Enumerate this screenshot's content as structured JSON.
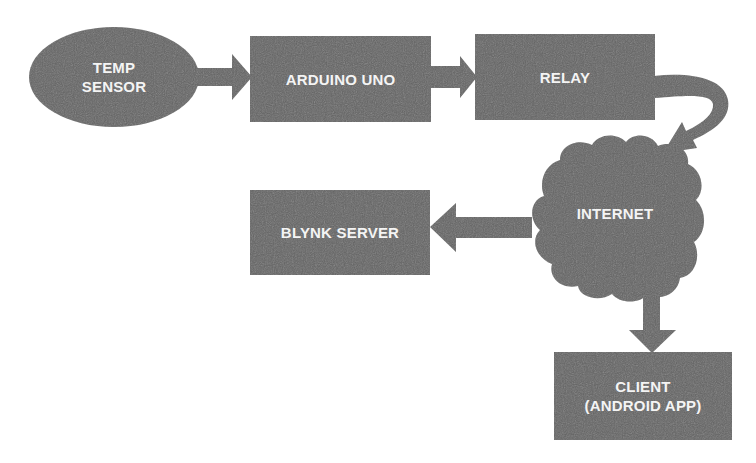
{
  "diagram": {
    "type": "flowchart",
    "colors": {
      "background": "#ffffff",
      "node_fill": "#646464",
      "arrow_fill": "#646464",
      "text": "#f4f4f4"
    },
    "nodes": {
      "temp_sensor": {
        "line1": "TEMP",
        "line2": "SENSOR",
        "shape": "ellipse"
      },
      "arduino": {
        "label": "ARDUINO UNO",
        "shape": "rectangle"
      },
      "relay": {
        "label": "RELAY",
        "shape": "rectangle"
      },
      "internet": {
        "label": "INTERNET",
        "shape": "cloud"
      },
      "blynk": {
        "label": "BLYNK SERVER",
        "shape": "rectangle"
      },
      "client": {
        "line1": "CLIENT",
        "line2": "(ANDROID APP)",
        "shape": "rectangle"
      }
    },
    "edges": [
      {
        "from": "TEMP SENSOR",
        "to": "ARDUINO UNO"
      },
      {
        "from": "ARDUINO UNO",
        "to": "RELAY"
      },
      {
        "from": "RELAY",
        "to": "INTERNET"
      },
      {
        "from": "INTERNET",
        "to": "BLYNK SERVER"
      },
      {
        "from": "INTERNET",
        "to": "CLIENT (ANDROID APP)"
      }
    ]
  }
}
